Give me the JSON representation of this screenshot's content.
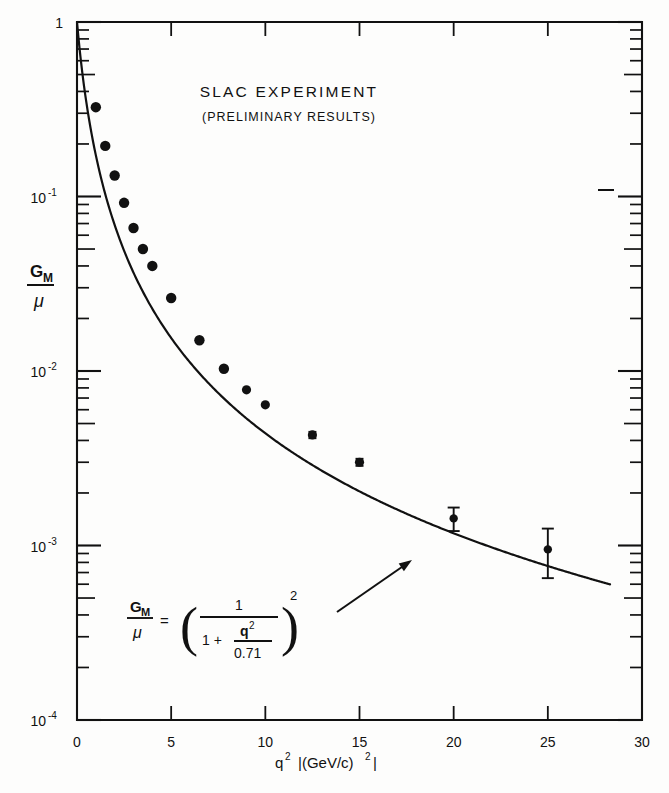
{
  "figure": {
    "title": "SLAC EXPERIMENT",
    "subtitle": "(PRELIMINARY RESULTS)",
    "background_color": "#fdfdfc",
    "ink_color": "#111111"
  },
  "annotations": {
    "equation": {
      "lhs_num": "G",
      "lhs_sub": "M",
      "lhs_den": "μ",
      "equals": "=",
      "paren_open": "(",
      "paren_close": ")",
      "frac_num": "1",
      "frac_den_one": "1 +",
      "frac_den_num": "q",
      "frac_den_num_sup": "2",
      "frac_den_den": "0.71",
      "exponent": "2",
      "plain": "G_M/μ = ( 1 / (1 + q²/0.71) )²"
    },
    "pointer": {
      "name": "arrow-to-curve",
      "from_x": 337,
      "from_y": 612,
      "to_x": 412,
      "to_y": 560
    },
    "stray_dash": {
      "x": 598,
      "y": 190,
      "width": 16
    }
  },
  "chart_data": {
    "type": "scatter",
    "title": "SLAC EXPERIMENT",
    "subtitle": "(PRELIMINARY RESULTS)",
    "xlabel": "q² |(GeV/c)²|",
    "ylabel": "G_M / μ",
    "ylabel_parts": {
      "numerator": "G",
      "numerator_sub": "M",
      "denominator": "μ"
    },
    "xscale": "linear",
    "yscale": "log",
    "xlim": [
      0,
      30
    ],
    "ylim": [
      0.0001,
      1
    ],
    "grid": false,
    "legend": false,
    "xticks": [
      0,
      5,
      10,
      15,
      20,
      25,
      30
    ],
    "xticklabels": [
      "0",
      "5",
      "10",
      "15",
      "20",
      "25",
      "30"
    ],
    "yticks": [
      1,
      0.1,
      0.01,
      0.001,
      0.0001
    ],
    "yticklabels": [
      "1",
      "10⁻¹",
      "10⁻²",
      "10⁻³",
      "10⁻⁴"
    ],
    "ytick_mantissas": [
      "1",
      "10",
      "10",
      "10",
      "10"
    ],
    "ytick_exponents": [
      "",
      "-1",
      "-2",
      "-3",
      "-4"
    ],
    "series": [
      {
        "name": "SLAC data",
        "marker": "filled-circle",
        "marker_color": "#111111",
        "x": [
          1.0,
          1.5,
          2.0,
          2.5,
          3.0,
          3.5,
          4.0,
          5.0,
          6.5,
          7.8,
          9.0,
          10.0,
          12.5,
          15.0,
          20.0,
          25.0
        ],
        "y": [
          0.325,
          0.195,
          0.132,
          0.092,
          0.066,
          0.05,
          0.04,
          0.0262,
          0.015,
          0.0103,
          0.0078,
          0.0064,
          0.0043,
          0.003,
          0.00143,
          0.00095
        ],
        "yerr": [
          0,
          0,
          0,
          0,
          0,
          0,
          0,
          0,
          0,
          0,
          0,
          0,
          0.00018,
          0.00014,
          0.00022,
          0.0003
        ]
      },
      {
        "name": "dipole fit",
        "type": "line",
        "line_color": "#111111",
        "formula": "(1 + q^2/0.71)^-2",
        "x_range": [
          0.0,
          28.3
        ]
      }
    ]
  }
}
